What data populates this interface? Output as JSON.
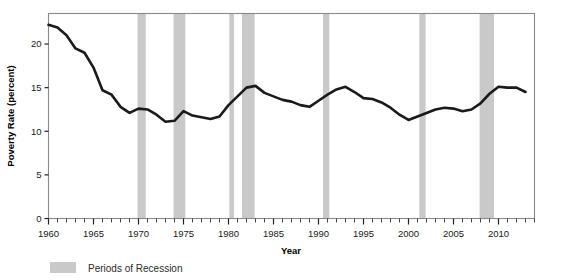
{
  "chart_data": {
    "type": "line",
    "title": "",
    "xlabel": "Year",
    "ylabel": "Poverty Rate (percent)",
    "xlim": [
      1960,
      2014
    ],
    "ylim": [
      0,
      23.5
    ],
    "yticks": [
      0,
      5,
      10,
      15,
      20
    ],
    "ytick_labels": [
      "0",
      "5",
      "10",
      "15",
      "20"
    ],
    "xticks": [
      1960,
      1965,
      1970,
      1975,
      1980,
      1985,
      1990,
      1995,
      2000,
      2005,
      2010
    ],
    "xtick_labels": [
      "1960",
      "1965",
      "1970",
      "1975",
      "1980",
      "1985",
      "1990",
      "1995",
      "2000",
      "2005",
      "2010"
    ],
    "xminor_step": 1,
    "grid": false,
    "legend_position": "below-left",
    "series": [
      {
        "name": "Poverty Rate",
        "color": "#1a1a1a",
        "x": [
          1960,
          1961,
          1962,
          1963,
          1964,
          1965,
          1966,
          1967,
          1968,
          1969,
          1970,
          1971,
          1972,
          1973,
          1974,
          1975,
          1976,
          1977,
          1978,
          1979,
          1980,
          1981,
          1982,
          1983,
          1984,
          1985,
          1986,
          1987,
          1988,
          1989,
          1990,
          1991,
          1992,
          1993,
          1994,
          1995,
          1996,
          1997,
          1998,
          1999,
          2000,
          2001,
          2002,
          2003,
          2004,
          2005,
          2006,
          2007,
          2008,
          2009,
          2010,
          2011,
          2012,
          2013
        ],
        "values": [
          22.2,
          21.9,
          21.0,
          19.5,
          19.0,
          17.3,
          14.7,
          14.2,
          12.8,
          12.1,
          12.6,
          12.5,
          11.9,
          11.1,
          11.2,
          12.3,
          11.8,
          11.6,
          11.4,
          11.7,
          13.0,
          14.0,
          15.0,
          15.2,
          14.4,
          14.0,
          13.6,
          13.4,
          13.0,
          12.8,
          13.5,
          14.2,
          14.8,
          15.1,
          14.5,
          13.8,
          13.7,
          13.3,
          12.7,
          11.9,
          11.3,
          11.7,
          12.1,
          12.5,
          12.7,
          12.6,
          12.3,
          12.5,
          13.2,
          14.3,
          15.1,
          15.0,
          15.0,
          14.5
        ],
        "ylabel_unit": "percent"
      }
    ],
    "recession_bands": [
      {
        "start": 1969.9,
        "end": 1970.8,
        "label": "1969-1970"
      },
      {
        "start": 1973.9,
        "end": 1975.2,
        "label": "1973-1975"
      },
      {
        "start": 1980.1,
        "end": 1980.6,
        "label": "1980"
      },
      {
        "start": 1981.5,
        "end": 1982.9,
        "label": "1981-1982"
      },
      {
        "start": 1990.5,
        "end": 1991.2,
        "label": "1990-1991"
      },
      {
        "start": 2001.2,
        "end": 2001.9,
        "label": "2001"
      },
      {
        "start": 2007.9,
        "end": 2009.5,
        "label": "2007-2009"
      }
    ],
    "band_color": "#c9c9c9",
    "legend": [
      {
        "label": "Periods of Recession",
        "color": "#c9c9c9"
      }
    ]
  }
}
